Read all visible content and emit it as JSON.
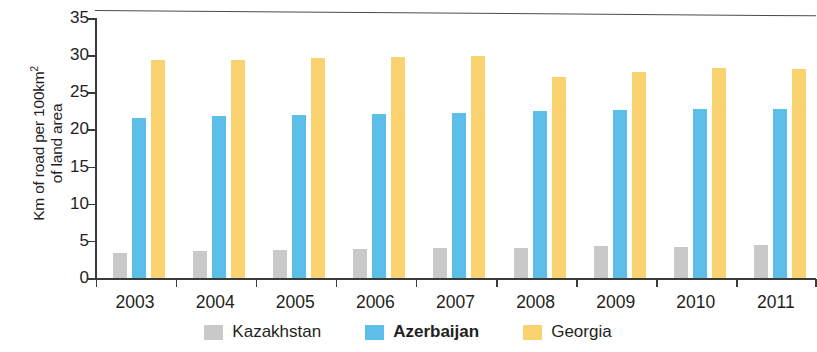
{
  "chart_data": {
    "type": "bar",
    "title": "",
    "subtitle": "",
    "xlabel": "",
    "ylabel": "Km of road per 100km2 of land area",
    "ylabel_parts": {
      "line1_pre": "Km of road per 100km",
      "line1_sup": "2",
      "line2": "of land area"
    },
    "categories": [
      "2003",
      "2004",
      "2005",
      "2006",
      "2007",
      "2008",
      "2009",
      "2010",
      "2011"
    ],
    "series": [
      {
        "name": "Kazakhstan",
        "color": "#c9c9c9",
        "bold": false,
        "values": [
          3.4,
          3.6,
          3.8,
          3.9,
          4.0,
          4.1,
          4.3,
          4.2,
          4.5
        ]
      },
      {
        "name": "Azerbaijan",
        "color": "#5bbfea",
        "bold": true,
        "values": [
          21.6,
          21.8,
          22.0,
          22.1,
          22.2,
          22.5,
          22.6,
          22.7,
          22.8
        ]
      },
      {
        "name": "Georgia",
        "color": "#fad370",
        "bold": false,
        "values": [
          29.3,
          29.4,
          29.6,
          29.8,
          29.9,
          27.0,
          27.7,
          28.3,
          28.1
        ]
      }
    ],
    "ylim": [
      0,
      35
    ],
    "yticks": [
      0,
      5,
      10,
      15,
      20,
      25,
      30,
      35
    ],
    "ytick_labels": [
      "0",
      "5",
      "10",
      "15",
      "20",
      "25",
      "30",
      "35"
    ],
    "grid": false,
    "legend_position": "bottom-center"
  },
  "colors": {
    "kazakhstan": "#c9c9c9",
    "azerbaijan": "#5bbfea",
    "georgia": "#fad370",
    "axis": "#3b3b3b",
    "text": "#231f20",
    "background": "#ffffff"
  }
}
